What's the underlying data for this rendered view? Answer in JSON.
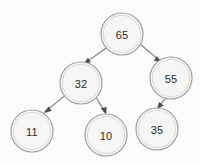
{
  "diagram": {
    "type": "binary-tree",
    "background_color": "#fdfdfc",
    "node_fill_color": "#f7f7f6",
    "node_stroke_color": "#9c9c9c",
    "edge_color": "#7d7d7d",
    "arrowhead_color": "#4a4a4a",
    "label_color": "#2b2b2b",
    "node_radius": 21,
    "nodes": [
      {
        "id": "n65",
        "label": "65",
        "cx": 122,
        "cy": 34,
        "r": 21,
        "role": "root",
        "depth": 0
      },
      {
        "id": "n32",
        "label": "32",
        "cx": 81,
        "cy": 83,
        "r": 21,
        "role": "left-child",
        "depth": 1
      },
      {
        "id": "n55",
        "label": "55",
        "cx": 171,
        "cy": 78,
        "r": 21,
        "role": "right-child",
        "depth": 1
      },
      {
        "id": "n11",
        "label": "11",
        "cx": 32,
        "cy": 131,
        "r": 21,
        "role": "leaf",
        "depth": 2
      },
      {
        "id": "n10",
        "label": "10",
        "cx": 106,
        "cy": 135,
        "r": 21,
        "role": "leaf",
        "depth": 2
      },
      {
        "id": "n35",
        "label": "35",
        "cx": 157,
        "cy": 129,
        "r": 21,
        "role": "leaf",
        "depth": 2
      }
    ],
    "edges": [
      {
        "id": "e65-32",
        "from": "n65",
        "to": "n32",
        "from_label": "65",
        "to_label": "32",
        "side": "left",
        "arrow": true
      },
      {
        "id": "e65-55",
        "from": "n65",
        "to": "n55",
        "from_label": "65",
        "to_label": "55",
        "side": "right",
        "arrow": true
      },
      {
        "id": "e32-11",
        "from": "n32",
        "to": "n11",
        "from_label": "32",
        "to_label": "11",
        "side": "left",
        "arrow": true
      },
      {
        "id": "e32-10",
        "from": "n32",
        "to": "n10",
        "from_label": "32",
        "to_label": "10",
        "side": "right",
        "arrow": true
      },
      {
        "id": "e55-35",
        "from": "n55",
        "to": "n35",
        "from_label": "55",
        "to_label": "35",
        "side": "left",
        "arrow": true
      }
    ]
  }
}
